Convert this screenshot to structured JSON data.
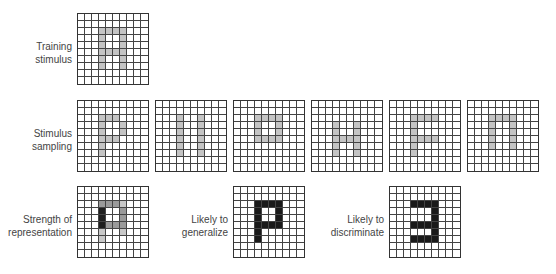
{
  "labels": {
    "training": [
      "Training",
      "stimulus"
    ],
    "sampling": [
      "Stimulus",
      "sampling"
    ],
    "strength": [
      "Strength of",
      "representation"
    ],
    "generalize": [
      "Likely to",
      "generalize"
    ],
    "discriminate": [
      "Likely to",
      "discriminate"
    ]
  },
  "colors": {
    "gray": "#c4c4c4",
    "strong": "#1e1e1e",
    "medium": "#9a9a9a",
    "light": "#c8c8c8",
    "black": "#1a1a1a"
  },
  "grids": {
    "training": {
      "x": 77,
      "y": 13,
      "cells": {
        "gray": [
          [
            2,
            3
          ],
          [
            2,
            4
          ],
          [
            2,
            5
          ],
          [
            2,
            6
          ],
          [
            3,
            3
          ],
          [
            3,
            6
          ],
          [
            4,
            3
          ],
          [
            4,
            6
          ],
          [
            5,
            3
          ],
          [
            5,
            4
          ],
          [
            5,
            5
          ],
          [
            5,
            6
          ],
          [
            6,
            3
          ],
          [
            6,
            6
          ],
          [
            7,
            3
          ],
          [
            7,
            6
          ]
        ]
      }
    },
    "samples": [
      {
        "x": 77,
        "y": 100,
        "cells": {
          "gray": [
            [
              2,
              3
            ],
            [
              2,
              4
            ],
            [
              2,
              5
            ],
            [
              3,
              3
            ],
            [
              3,
              6
            ],
            [
              4,
              3
            ],
            [
              4,
              6
            ],
            [
              5,
              3
            ],
            [
              5,
              4
            ],
            [
              5,
              5
            ],
            [
              6,
              3
            ],
            [
              7,
              3
            ]
          ]
        }
      },
      {
        "x": 155,
        "y": 100,
        "cells": {
          "gray": [
            [
              2,
              3
            ],
            [
              3,
              3
            ],
            [
              4,
              3
            ],
            [
              5,
              3
            ],
            [
              6,
              3
            ],
            [
              7,
              3
            ],
            [
              2,
              6
            ],
            [
              3,
              6
            ],
            [
              4,
              6
            ],
            [
              5,
              6
            ],
            [
              6,
              6
            ],
            [
              7,
              6
            ]
          ]
        }
      },
      {
        "x": 233,
        "y": 100,
        "cells": {
          "gray": [
            [
              2,
              3
            ],
            [
              2,
              4
            ],
            [
              2,
              5
            ],
            [
              2,
              6
            ],
            [
              3,
              3
            ],
            [
              3,
              6
            ],
            [
              4,
              3
            ],
            [
              4,
              6
            ],
            [
              5,
              3
            ],
            [
              5,
              4
            ],
            [
              5,
              5
            ],
            [
              5,
              6
            ]
          ]
        }
      },
      {
        "x": 311,
        "y": 100,
        "cells": {
          "gray": [
            [
              3,
              3
            ],
            [
              4,
              3
            ],
            [
              5,
              3
            ],
            [
              6,
              3
            ],
            [
              7,
              3
            ],
            [
              3,
              6
            ],
            [
              4,
              6
            ],
            [
              5,
              6
            ],
            [
              6,
              6
            ],
            [
              7,
              6
            ],
            [
              5,
              4
            ],
            [
              5,
              5
            ]
          ]
        }
      },
      {
        "x": 389,
        "y": 100,
        "cells": {
          "gray": [
            [
              2,
              3
            ],
            [
              2,
              4
            ],
            [
              2,
              5
            ],
            [
              2,
              6
            ],
            [
              3,
              3
            ],
            [
              4,
              3
            ],
            [
              5,
              3
            ],
            [
              5,
              4
            ],
            [
              5,
              5
            ],
            [
              5,
              6
            ],
            [
              6,
              3
            ],
            [
              7,
              3
            ]
          ]
        }
      },
      {
        "x": 467,
        "y": 100,
        "cells": {
          "gray": [
            [
              2,
              3
            ],
            [
              2,
              4
            ],
            [
              2,
              5
            ],
            [
              2,
              6
            ],
            [
              3,
              3
            ],
            [
              3,
              6
            ],
            [
              4,
              3
            ],
            [
              4,
              6
            ],
            [
              5,
              3
            ],
            [
              5,
              6
            ],
            [
              6,
              3
            ],
            [
              6,
              6
            ]
          ]
        }
      }
    ],
    "strength": {
      "x": 77,
      "y": 186,
      "cells": {
        "strong": [
          [
            3,
            3
          ],
          [
            4,
            3
          ],
          [
            5,
            3
          ]
        ],
        "medium": [
          [
            2,
            3
          ],
          [
            2,
            4
          ],
          [
            2,
            5
          ],
          [
            3,
            6
          ],
          [
            4,
            6
          ],
          [
            5,
            6
          ],
          [
            5,
            4
          ],
          [
            5,
            5
          ]
        ],
        "light": [
          [
            2,
            6
          ],
          [
            6,
            3
          ],
          [
            7,
            3
          ],
          [
            6,
            6
          ]
        ]
      }
    },
    "generalize": {
      "x": 233,
      "y": 186,
      "cells": {
        "black": [
          [
            2,
            3
          ],
          [
            2,
            4
          ],
          [
            2,
            5
          ],
          [
            2,
            6
          ],
          [
            3,
            3
          ],
          [
            3,
            6
          ],
          [
            4,
            3
          ],
          [
            4,
            6
          ],
          [
            5,
            3
          ],
          [
            5,
            4
          ],
          [
            5,
            5
          ],
          [
            5,
            6
          ],
          [
            6,
            3
          ],
          [
            7,
            3
          ]
        ]
      }
    },
    "discriminate": {
      "x": 389,
      "y": 186,
      "cells": {
        "black": [
          [
            2,
            3
          ],
          [
            2,
            4
          ],
          [
            2,
            5
          ],
          [
            2,
            6
          ],
          [
            3,
            6
          ],
          [
            4,
            6
          ],
          [
            5,
            3
          ],
          [
            5,
            4
          ],
          [
            5,
            5
          ],
          [
            5,
            6
          ],
          [
            6,
            6
          ],
          [
            7,
            3
          ],
          [
            7,
            4
          ],
          [
            7,
            5
          ],
          [
            7,
            6
          ]
        ]
      }
    }
  }
}
